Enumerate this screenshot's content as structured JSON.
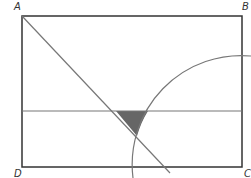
{
  "diagram": {
    "labels": {
      "a": "A",
      "b": "B",
      "c": "C",
      "d": "D"
    },
    "colors": {
      "rectangle": "#333333",
      "lines": "#777777",
      "shaded_region": "#666666",
      "background": "#ffffff"
    },
    "points": {
      "A": [
        22,
        16
      ],
      "B": [
        242,
        16
      ],
      "C": [
        242,
        167
      ],
      "D": [
        22,
        167
      ]
    },
    "elements": [
      "rectangle ABCD",
      "diagonal from A toward C (extends below DC)",
      "horizontal midline parallel to AD-BC midpoints",
      "quarter-circle arc centered at C",
      "shaded triangular region bounded by diagonal, midline and arc"
    ]
  }
}
